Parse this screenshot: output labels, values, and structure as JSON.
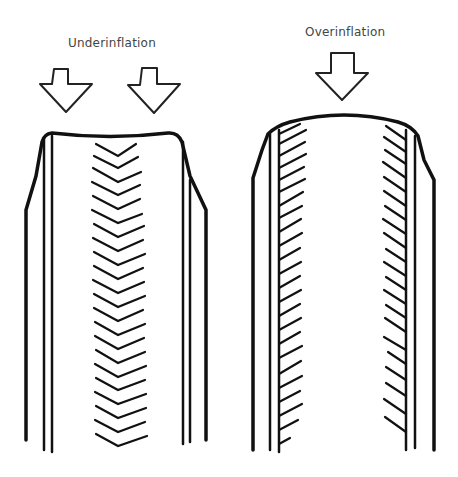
{
  "diagram": {
    "type": "illustration",
    "panels": [
      {
        "id": "underinflation",
        "label": "Underinflation",
        "arrows": 2,
        "wear_location": "center tread (chevron pattern)",
        "shoulder_shape": "crown dipped in center"
      },
      {
        "id": "overinflation",
        "label": "Overinflation",
        "arrows": 1,
        "wear_location": "both shoulders (diagonal hatching)",
        "shoulder_shape": "crown bulged upward"
      }
    ],
    "colors": {
      "line": "#111111",
      "label": "#444444",
      "background": "#ffffff"
    }
  }
}
